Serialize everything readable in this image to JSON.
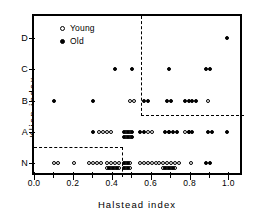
{
  "chart_data": {
    "type": "scatter",
    "title": "",
    "xlabel": "Halstead index",
    "ylabel": "Klien index",
    "xlim": [
      0.0,
      1.08
    ],
    "ylim_categories": [
      "N",
      "A",
      "B",
      "C",
      "D"
    ],
    "grid": false,
    "legend_position": "top-left",
    "x_ticks": [
      0.0,
      0.1,
      0.2,
      0.3,
      0.4,
      0.5,
      0.6,
      0.7,
      0.8,
      0.9,
      1.0
    ],
    "x_tick_labels": [
      "0.0",
      "",
      "0.2",
      "",
      "0.4",
      "",
      "0.6",
      "",
      "0.8",
      "",
      "1.0"
    ],
    "y_ticks": [
      "N",
      "A",
      "B",
      "C",
      "D"
    ],
    "series": [
      {
        "name": "Young",
        "marker": "open-circle",
        "color": "#ffffff",
        "edge_color": "#000000",
        "points": [
          {
            "x": 0.105,
            "y": "N"
          },
          {
            "x": 0.125,
            "y": "N"
          },
          {
            "x": 0.205,
            "y": "N"
          },
          {
            "x": 0.285,
            "y": "N"
          },
          {
            "x": 0.305,
            "y": "N"
          },
          {
            "x": 0.325,
            "y": "N"
          },
          {
            "x": 0.345,
            "y": "N"
          },
          {
            "x": 0.375,
            "y": "N"
          },
          {
            "x": 0.395,
            "y": "N"
          },
          {
            "x": 0.415,
            "y": "N"
          },
          {
            "x": 0.435,
            "y": "N"
          },
          {
            "x": 0.375,
            "y": "N2"
          },
          {
            "x": 0.395,
            "y": "N2"
          },
          {
            "x": 0.415,
            "y": "N2"
          },
          {
            "x": 0.435,
            "y": "N2"
          },
          {
            "x": 0.475,
            "y": "N"
          },
          {
            "x": 0.495,
            "y": "N"
          },
          {
            "x": 0.475,
            "y": "N2"
          },
          {
            "x": 0.495,
            "y": "N2"
          },
          {
            "x": 0.545,
            "y": "N"
          },
          {
            "x": 0.565,
            "y": "N"
          },
          {
            "x": 0.585,
            "y": "N"
          },
          {
            "x": 0.605,
            "y": "N"
          },
          {
            "x": 0.625,
            "y": "N"
          },
          {
            "x": 0.645,
            "y": "N"
          },
          {
            "x": 0.665,
            "y": "N"
          },
          {
            "x": 0.685,
            "y": "N"
          },
          {
            "x": 0.705,
            "y": "N"
          },
          {
            "x": 0.725,
            "y": "N"
          },
          {
            "x": 0.745,
            "y": "N"
          },
          {
            "x": 0.665,
            "y": "N2"
          },
          {
            "x": 0.685,
            "y": "N2"
          },
          {
            "x": 0.705,
            "y": "N2"
          },
          {
            "x": 0.725,
            "y": "N2"
          },
          {
            "x": 0.805,
            "y": "N"
          },
          {
            "x": 0.335,
            "y": "A"
          },
          {
            "x": 0.355,
            "y": "A"
          },
          {
            "x": 0.375,
            "y": "A"
          },
          {
            "x": 0.395,
            "y": "A"
          },
          {
            "x": 0.475,
            "y": "A"
          },
          {
            "x": 0.495,
            "y": "A"
          },
          {
            "x": 0.475,
            "y": "A2"
          },
          {
            "x": 0.495,
            "y": "A2"
          },
          {
            "x": 0.585,
            "y": "A"
          },
          {
            "x": 0.605,
            "y": "A"
          },
          {
            "x": 0.695,
            "y": "A"
          },
          {
            "x": 0.775,
            "y": "A"
          },
          {
            "x": 0.795,
            "y": "A"
          },
          {
            "x": 0.495,
            "y": "B"
          },
          {
            "x": 0.515,
            "y": "B"
          },
          {
            "x": 0.895,
            "y": "B"
          }
        ]
      },
      {
        "name": "Old",
        "marker": "filled-circle",
        "color": "#000000",
        "edge_color": "#000000",
        "points": [
          {
            "x": 0.385,
            "y": "N2"
          },
          {
            "x": 0.405,
            "y": "N2"
          },
          {
            "x": 0.425,
            "y": "N2"
          },
          {
            "x": 0.465,
            "y": "N"
          },
          {
            "x": 0.485,
            "y": "N"
          },
          {
            "x": 0.465,
            "y": "N2"
          },
          {
            "x": 0.485,
            "y": "N2"
          },
          {
            "x": 0.675,
            "y": "N2"
          },
          {
            "x": 0.695,
            "y": "N2"
          },
          {
            "x": 0.715,
            "y": "N2"
          },
          {
            "x": 0.885,
            "y": "N"
          },
          {
            "x": 0.905,
            "y": "N"
          },
          {
            "x": 0.305,
            "y": "A"
          },
          {
            "x": 0.465,
            "y": "A"
          },
          {
            "x": 0.485,
            "y": "A"
          },
          {
            "x": 0.505,
            "y": "A"
          },
          {
            "x": 0.465,
            "y": "A2"
          },
          {
            "x": 0.485,
            "y": "A2"
          },
          {
            "x": 0.505,
            "y": "A2"
          },
          {
            "x": 0.545,
            "y": "A"
          },
          {
            "x": 0.565,
            "y": "A"
          },
          {
            "x": 0.675,
            "y": "A"
          },
          {
            "x": 0.695,
            "y": "A"
          },
          {
            "x": 0.715,
            "y": "A"
          },
          {
            "x": 0.735,
            "y": "A"
          },
          {
            "x": 0.795,
            "y": "A"
          },
          {
            "x": 0.815,
            "y": "A"
          },
          {
            "x": 0.895,
            "y": "A"
          },
          {
            "x": 0.915,
            "y": "A"
          },
          {
            "x": 0.995,
            "y": "A"
          },
          {
            "x": 0.105,
            "y": "B"
          },
          {
            "x": 0.305,
            "y": "B"
          },
          {
            "x": 0.565,
            "y": "B"
          },
          {
            "x": 0.585,
            "y": "B"
          },
          {
            "x": 0.685,
            "y": "B"
          },
          {
            "x": 0.705,
            "y": "B"
          },
          {
            "x": 0.775,
            "y": "B"
          },
          {
            "x": 0.795,
            "y": "B"
          },
          {
            "x": 0.815,
            "y": "B"
          },
          {
            "x": 0.835,
            "y": "B"
          },
          {
            "x": 0.415,
            "y": "C"
          },
          {
            "x": 0.505,
            "y": "C"
          },
          {
            "x": 0.695,
            "y": "C"
          },
          {
            "x": 0.885,
            "y": "C"
          },
          {
            "x": 0.905,
            "y": "C"
          },
          {
            "x": 0.995,
            "y": "D"
          }
        ]
      }
    ],
    "annotations": [
      {
        "name": "upper-right-partition",
        "type": "dashed-box",
        "x_start": 0.55,
        "y_start_category": "B",
        "note": "dashed lines enclosing upper-right region"
      },
      {
        "name": "lower-left-partition",
        "type": "dashed-box",
        "x_end": 0.46,
        "y_end_category": "N",
        "note": "dashed lines enclosing lower-left region"
      }
    ]
  },
  "legend": {
    "entries": [
      {
        "label": "Young",
        "marker": "open-circle"
      },
      {
        "label": "Old",
        "marker": "filled-circle"
      }
    ]
  }
}
